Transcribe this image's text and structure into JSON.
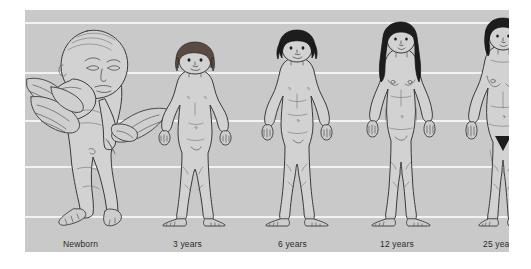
{
  "figure": {
    "panel": {
      "background_color": "#c9c9c9",
      "gridline_color": "#f2f2f2",
      "gridline_count": 5
    },
    "label_text_color": "#2b2b2b"
  },
  "stages": [
    {
      "id": "newborn",
      "label": "Newborn",
      "icon": "newborn-held-by-hands-icon",
      "pose": "held upright by adult hands",
      "hair": "none",
      "relative_height_pct": 100,
      "head_to_body_ratio": "1:4"
    },
    {
      "id": "age-3",
      "label": "3 years",
      "icon": "child-standing-icon",
      "pose": "standing, arms at sides",
      "hair": "brown bob",
      "relative_height_pct": 88,
      "head_to_body_ratio": "1:5"
    },
    {
      "id": "age-6",
      "label": "6 years",
      "icon": "child-standing-icon",
      "pose": "standing, arms at sides",
      "hair": "dark short",
      "relative_height_pct": 92,
      "head_to_body_ratio": "1:6"
    },
    {
      "id": "age-12",
      "label": "12 years",
      "icon": "adolescent-standing-icon",
      "pose": "standing, arms at sides",
      "hair": "dark long",
      "relative_height_pct": 96,
      "head_to_body_ratio": "1:7"
    },
    {
      "id": "age-25",
      "label": "25 years",
      "icon": "adult-standing-icon",
      "pose": "standing, arms at sides",
      "hair": "dark bob",
      "relative_height_pct": 100,
      "head_to_body_ratio": "1:8"
    }
  ]
}
